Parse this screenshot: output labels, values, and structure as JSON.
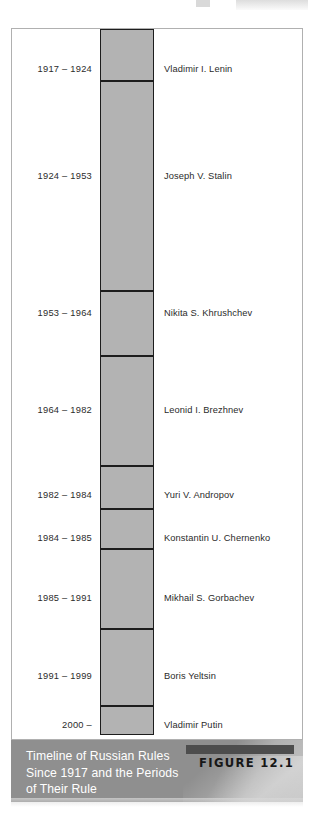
{
  "figure": {
    "label": "FIGURE 12.1",
    "caption": "Timeline of Russian Rules Since 1917 and the Periods of Their Rule",
    "caption_line1": "Timeline of Russian Rules",
    "caption_line2": "Since 1917 and the Periods",
    "caption_line3": "of Their Rule"
  },
  "colors": {
    "bar_fill": "#b3b3b3",
    "bar_stroke": "#1d1d1d",
    "frame_border": "#b0b0b0",
    "caption_background": "#8f8f8f",
    "caption_text": "#ffffff",
    "figure_tab": "#4d4d4d",
    "figure_label_text": "#171717",
    "body_text": "#2b2b2b",
    "page_background": "#ffffff"
  },
  "chart_data": {
    "type": "bar",
    "orientation": "vertical-stacked-timeline",
    "title": "Timeline of Russian Rules Since 1917 and the Periods of Their Rule",
    "xlabel": "",
    "ylabel": "Year",
    "ylim": [
      1917,
      2006
    ],
    "grid": false,
    "legend": false,
    "categories": [
      "Vladimir I. Lenin",
      "Joseph V. Stalin",
      "Nikita S. Khrushchev",
      "Leonid I. Brezhnev",
      "Yuri V. Andropov",
      "Konstantin U. Chernenko",
      "Mikhail S. Gorbachev",
      "Boris Yeltsin",
      "Vladimir Putin"
    ],
    "values": [
      7,
      29,
      11,
      18,
      2,
      1,
      6,
      8,
      6
    ],
    "tick_labels": [
      "1917 – 1924",
      "1924 – 1953",
      "1953 – 1964",
      "1964 – 1982",
      "1982 – 1984",
      "1984 – 1985",
      "1985 – 1991",
      "1991 – 1999",
      "2000 –"
    ],
    "segments": [
      {
        "years": "1917 – 1924",
        "name": "Vladimir I. Lenin",
        "start": 1917,
        "end": 1924,
        "duration": 7,
        "top": 0,
        "height": 52
      },
      {
        "years": "1924 – 1953",
        "name": "Joseph V. Stalin",
        "start": 1924,
        "end": 1953,
        "duration": 29,
        "top": 52,
        "height": 210
      },
      {
        "years": "1953 – 1964",
        "name": "Nikita S. Khrushchev",
        "start": 1953,
        "end": 1964,
        "duration": 11,
        "top": 262,
        "height": 65
      },
      {
        "years": "1964 – 1982",
        "name": "Leonid I. Brezhnev",
        "start": 1964,
        "end": 1982,
        "duration": 18,
        "top": 327,
        "height": 110
      },
      {
        "years": "1982 – 1984",
        "name": "Yuri V. Andropov",
        "start": 1982,
        "end": 1984,
        "duration": 2,
        "top": 437,
        "height": 43
      },
      {
        "years": "1984 – 1985",
        "name": "Konstantin U. Chernenko",
        "start": 1984,
        "end": 1985,
        "duration": 1,
        "top": 480,
        "height": 40
      },
      {
        "years": "1985 – 1991",
        "name": "Mikhail S. Gorbachev",
        "start": 1985,
        "end": 1991,
        "duration": 6,
        "top": 520,
        "height": 80
      },
      {
        "years": "1991 – 1999",
        "name": "Boris Yeltsin",
        "start": 1991,
        "end": 1999,
        "duration": 8,
        "top": 600,
        "height": 77
      },
      {
        "years": "2000 –",
        "name": "Vladimir Putin",
        "start": 2000,
        "end": null,
        "duration": 6,
        "top": 677,
        "height": 29
      }
    ],
    "label_rows": [
      {
        "years": "1917 – 1924",
        "name": "Vladimir I. Lenin",
        "y": 33
      },
      {
        "years": "1924 – 1953",
        "name": "Joseph V. Stalin",
        "y": 140
      },
      {
        "years": "1953 – 1964",
        "name": "Nikita S. Khrushchev",
        "y": 277
      },
      {
        "years": "1964 – 1982",
        "name": "Leonid I. Brezhnev",
        "y": 374
      },
      {
        "years": "1982 – 1984",
        "name": "Yuri V. Andropov",
        "y": 459
      },
      {
        "years": "1984 – 1985",
        "name": "Konstantin U. Chernenko",
        "y": 502
      },
      {
        "years": "1985 – 1991",
        "name": "Mikhail S. Gorbachev",
        "y": 562
      },
      {
        "years": "1991 – 1999",
        "name": "Boris Yeltsin",
        "y": 640
      },
      {
        "years": "2000 –",
        "name": "Vladimir Putin",
        "y": 689
      }
    ]
  }
}
